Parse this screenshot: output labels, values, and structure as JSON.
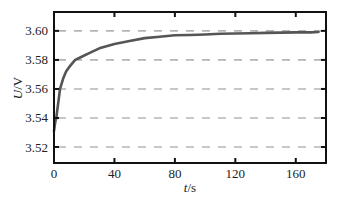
{
  "chart_data": {
    "type": "line",
    "title": "",
    "xlabel": "t/s",
    "ylabel": "U/V",
    "xlim": [
      0,
      180
    ],
    "ylim": [
      3.509,
      3.613
    ],
    "xticks": [
      0,
      40,
      80,
      120,
      160
    ],
    "yticks": [
      3.52,
      3.54,
      3.56,
      3.58,
      3.6
    ],
    "xtick_labels": [
      "0",
      "40",
      "80",
      "120",
      "160"
    ],
    "ytick_labels": [
      "3.52",
      "3.54",
      "3.56",
      "3.58",
      "3.60"
    ],
    "grid": "horizontal dashed",
    "legend": null,
    "series": [
      {
        "name": "U",
        "color": "#555555",
        "x": [
          0,
          0.5,
          1,
          1.5,
          2,
          3,
          4,
          6,
          8,
          10,
          14,
          18,
          24,
          30,
          40,
          50,
          60,
          70,
          80,
          90,
          100,
          110,
          120,
          130,
          140,
          150,
          160,
          170,
          175
        ],
        "y": [
          3.531,
          3.535,
          3.538,
          3.54,
          3.544,
          3.552,
          3.56,
          3.567,
          3.572,
          3.575,
          3.58,
          3.582,
          3.585,
          3.588,
          3.591,
          3.593,
          3.595,
          3.596,
          3.597,
          3.5972,
          3.5975,
          3.598,
          3.5982,
          3.5984,
          3.5986,
          3.5988,
          3.599,
          3.599,
          3.5992
        ]
      }
    ]
  },
  "labels": {
    "xlabel_italic": "t",
    "xlabel_unit": "/s",
    "ylabel_italic": "U",
    "ylabel_unit": "/V"
  },
  "colors": {
    "axis": "#111111",
    "grid": "#b5b5b5",
    "line": "#555555"
  }
}
